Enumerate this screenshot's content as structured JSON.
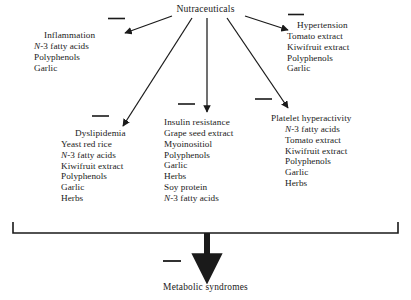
{
  "diagram": {
    "root": {
      "label": "Nutraceuticals"
    },
    "outcome": {
      "label": "Metabolic syndromes"
    },
    "edge_sign": "—",
    "edge_sign_meaning": "inhibition-minus-sign",
    "nodes": [
      {
        "id": "inflammation",
        "title": "Inflammation",
        "items": [
          {
            "prefix": "N",
            "rest": "-3 fatty acids"
          },
          {
            "prefix": "",
            "rest": "Polyphenols"
          },
          {
            "prefix": "",
            "rest": "Garlic"
          }
        ]
      },
      {
        "id": "hypertension",
        "title": "Hypertension",
        "items": [
          {
            "prefix": "",
            "rest": "Tomato extract"
          },
          {
            "prefix": "",
            "rest": "Kiwifruit extract"
          },
          {
            "prefix": "",
            "rest": "Polyphenols"
          },
          {
            "prefix": "",
            "rest": "Garlic"
          }
        ]
      },
      {
        "id": "dyslipidemia",
        "title": "Dyslipidemia",
        "items": [
          {
            "prefix": "",
            "rest": "Yeast red rice"
          },
          {
            "prefix": "N",
            "rest": "-3 fatty acids"
          },
          {
            "prefix": "",
            "rest": "Kiwifruit extract"
          },
          {
            "prefix": "",
            "rest": "Polyphenols"
          },
          {
            "prefix": "",
            "rest": "Garlic"
          },
          {
            "prefix": "",
            "rest": "Herbs"
          }
        ]
      },
      {
        "id": "insulin-resistance",
        "title": "Insulin resistance",
        "items": [
          {
            "prefix": "",
            "rest": "Grape seed extract"
          },
          {
            "prefix": "",
            "rest": "Myoinositiol"
          },
          {
            "prefix": "",
            "rest": "Polyphenols"
          },
          {
            "prefix": "",
            "rest": "Garlic"
          },
          {
            "prefix": "",
            "rest": "Herbs"
          },
          {
            "prefix": "",
            "rest": "Soy protein"
          },
          {
            "prefix": "N",
            "rest": "-3 fatty acids"
          }
        ]
      },
      {
        "id": "platelet-hyperactivity",
        "title": "Platelet  hyperactivity",
        "items": [
          {
            "prefix": "N",
            "rest": "-3 fatty acids"
          },
          {
            "prefix": "",
            "rest": "Tomato extract"
          },
          {
            "prefix": "",
            "rest": "Kiwifruit extract"
          },
          {
            "prefix": "",
            "rest": "Polyphenols"
          },
          {
            "prefix": "",
            "rest": "Garlic"
          },
          {
            "prefix": "",
            "rest": "Herbs"
          }
        ]
      }
    ],
    "colors": {
      "ink": "#1a1a1a",
      "background": "#ffffff"
    }
  }
}
